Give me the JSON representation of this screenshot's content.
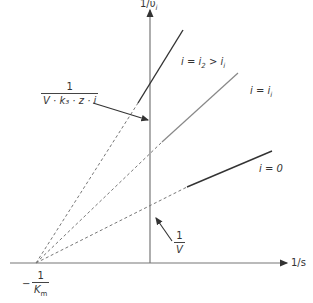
{
  "diagram": {
    "type": "lineweaver-burk-inhibition-plot",
    "axes": {
      "y_label": "1/υ",
      "y_label_sub": "i",
      "x_label": "1/s"
    },
    "lines": [
      {
        "id": "i2",
        "label_prefix": "i = i",
        "label_sub": "2",
        "label_suffix": " > i",
        "label_suffix_sub": "i",
        "style": "solid-dark"
      },
      {
        "id": "i1",
        "label_prefix": "i = i",
        "label_sub": "i",
        "label_suffix": "",
        "label_suffix_sub": "",
        "style": "solid-gray"
      },
      {
        "id": "i0",
        "label_prefix": "i = 0",
        "label_sub": "",
        "label_suffix": "",
        "label_suffix_sub": "",
        "style": "solid-dark"
      }
    ],
    "annotations": {
      "intercept_top": {
        "numerator": "1",
        "denominator": "V · k₃ · z · i"
      },
      "intercept_v": {
        "numerator": "1",
        "denominator": "V"
      },
      "x_intercept": {
        "sign": "−",
        "numerator": "1",
        "denominator": "K",
        "denominator_sub": "m"
      }
    },
    "colors": {
      "axis": "#777777",
      "line_dark": "#333333",
      "line_gray": "#888888",
      "dashed": "#777777"
    }
  }
}
